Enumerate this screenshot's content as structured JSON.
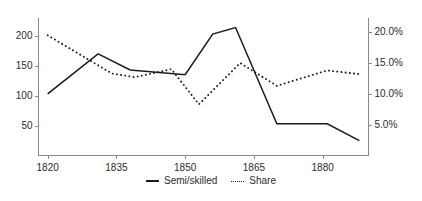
{
  "chart_data": {
    "type": "line",
    "title": "",
    "xlabel": "",
    "ylabel": "",
    "y2label": "",
    "grid": false,
    "legend_position": "bottom-center",
    "xlim": [
      1818,
      1890
    ],
    "xticks": [
      "1820",
      "1835",
      "1850",
      "1865",
      "1880"
    ],
    "xtick_values": [
      1820,
      1835,
      1850,
      1865,
      1880
    ],
    "ylim": [
      0,
      230
    ],
    "yticks": [
      "50",
      "100",
      "150",
      "200"
    ],
    "ytick_values": [
      50,
      100,
      150,
      200
    ],
    "y2lim": [
      0,
      22.3
    ],
    "y2ticks": [
      "5.0%",
      "10.0%",
      "15.0%",
      "20.0%"
    ],
    "y2tick_values": [
      5.0,
      10.0,
      15.0,
      20.0
    ],
    "series": [
      {
        "name": "Semi/skilled",
        "style": "solid",
        "axis": "left",
        "color": "#1a1a1a",
        "x": [
          1820,
          1831,
          1838,
          1850,
          1856,
          1861,
          1870,
          1881,
          1888
        ],
        "values": [
          103,
          170,
          143,
          135,
          203,
          214,
          53,
          53,
          25
        ]
      },
      {
        "name": "Share",
        "style": "dashed",
        "axis": "right",
        "color": "#1a1a1a",
        "x": [
          1820,
          1834,
          1839,
          1847,
          1853,
          1862,
          1870,
          1881,
          1888
        ],
        "values": [
          19.5,
          13.3,
          12.7,
          14.0,
          8.3,
          15.0,
          11.3,
          13.8,
          13.2
        ]
      }
    ],
    "legend": [
      "Semi/skilled",
      "Share"
    ]
  }
}
